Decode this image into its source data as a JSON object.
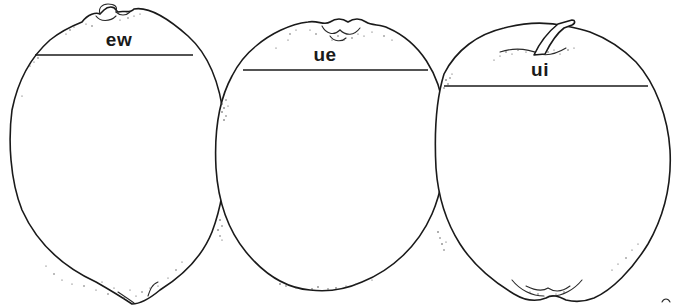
{
  "illustration": {
    "style": "black line-art worksheet",
    "background_color": "#ffffff",
    "line_color": "#1a1a1a",
    "fruits": [
      {
        "id": "lemon",
        "label": "ew"
      },
      {
        "id": "orange",
        "label": "ue"
      },
      {
        "id": "apple",
        "label": "ui"
      }
    ]
  }
}
